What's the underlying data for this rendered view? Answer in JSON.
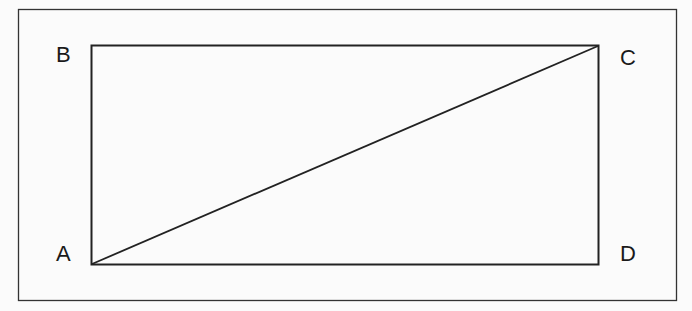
{
  "diagram": {
    "type": "rectangle-with-diagonal",
    "vertices": {
      "A": {
        "label": "A",
        "position": "bottom-left"
      },
      "B": {
        "label": "B",
        "position": "top-left"
      },
      "C": {
        "label": "C",
        "position": "top-right"
      },
      "D": {
        "label": "D",
        "position": "bottom-right"
      }
    },
    "edges": [
      "AB",
      "BC",
      "CD",
      "DA"
    ],
    "diagonal": "AC",
    "colors": {
      "stroke": "#222222",
      "background": "#fbfbfb",
      "text": "#1a1a1a"
    }
  }
}
